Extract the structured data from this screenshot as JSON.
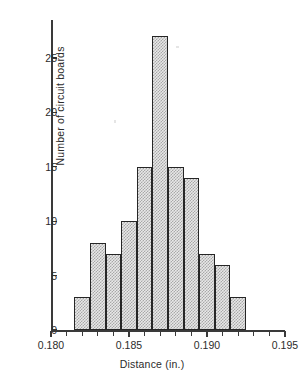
{
  "chart_data": {
    "type": "bar",
    "title": "",
    "xlabel": "Distance (in.)",
    "ylabel": "Number of circuit boards",
    "xlim": [
      0.18,
      0.195
    ],
    "ylim": [
      0,
      28
    ],
    "bin_width": 0.001,
    "bin_edges": [
      0.1815,
      0.1825,
      0.1835,
      0.1845,
      0.1855,
      0.1865,
      0.1875,
      0.1885,
      0.1895,
      0.1905,
      0.1915,
      0.1925
    ],
    "categories": [
      "0.1815-0.1825",
      "0.1825-0.1835",
      "0.1835-0.1845",
      "0.1845-0.1855",
      "0.1855-0.1865",
      "0.1865-0.1875",
      "0.1875-0.1885",
      "0.1885-0.1895",
      "0.1895-0.1905",
      "0.1905-0.1915",
      "0.1915-0.1925"
    ],
    "values": [
      3,
      8,
      7,
      10,
      15,
      27,
      15,
      14,
      7,
      6,
      3
    ],
    "x_tick_labels": [
      "0.180",
      "0.185",
      "0.190",
      "0.195"
    ],
    "x_tick_values": [
      0.18,
      0.185,
      0.19,
      0.195
    ],
    "x_minor_tick_count_per_interval": 5,
    "y_tick_labels": [
      "0",
      "5",
      "10",
      "15",
      "20",
      "25"
    ],
    "y_tick_values": [
      0,
      5,
      10,
      15,
      20,
      25
    ],
    "grid": false,
    "legend": false,
    "bar_fill_color": "#e8e8e8",
    "bar_pattern_color": "#a8a8a8",
    "bar_edge_color": "#262626",
    "axis_color": "#3a3a3a",
    "background_color": "#ffffff"
  }
}
